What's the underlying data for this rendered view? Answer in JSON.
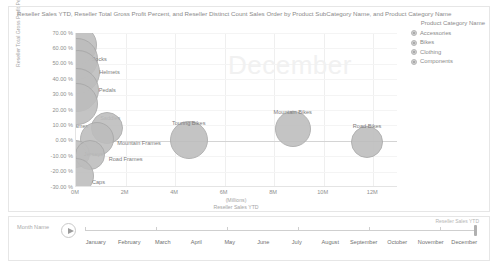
{
  "chart": {
    "title": "Reseller Sales YTD, Reseller Total Gross Profit Percent, and Reseller Distinct Count Sales Order by Product SubCategory Name, and Product Category Name",
    "watermark": "December"
  },
  "legend": {
    "title": "Product Category Name",
    "items": [
      {
        "label": "Accessories",
        "color": "#cfcfcf"
      },
      {
        "label": "Bikes",
        "color": "#cfcfcf"
      },
      {
        "label": "Clothing",
        "color": "#cfcfcf"
      },
      {
        "label": "Components",
        "color": "#cfcfcf"
      }
    ]
  },
  "slicer": {
    "field_label": "Month Name",
    "play_icon": "play-icon",
    "measure_label": "Reseller Sales YTD",
    "selected": "December",
    "months": [
      "January",
      "February",
      "March",
      "April",
      "May",
      "June",
      "July",
      "August",
      "September",
      "October",
      "November",
      "December"
    ]
  },
  "chart_data": {
    "type": "scatter",
    "title": "Reseller Sales YTD, Reseller Total Gross Profit Percent, and Reseller Distinct Count Sales Order by Product SubCategory Name, and Product Category Name",
    "xlabel": "Reseller Sales YTD",
    "xunit": "(Millions)",
    "ylabel": "Reseller Total Gross Profit Percent",
    "xlim": [
      0,
      13
    ],
    "ylim": [
      -30,
      70
    ],
    "xticks": [
      "0M",
      "2M",
      "4M",
      "6M",
      "8M",
      "10M",
      "12M"
    ],
    "xtickvals": [
      0,
      2,
      4,
      6,
      8,
      10,
      12
    ],
    "yticks": [
      "70.00 %",
      "60.00 %",
      "50.00 %",
      "40.00 %",
      "30.00 %",
      "20.00 %",
      "10.00 %",
      "0.00 %",
      "-10.00 %",
      "-20.00 %",
      "-30.00 %"
    ],
    "ytickvals": [
      70,
      60,
      50,
      40,
      30,
      20,
      10,
      0,
      -10,
      -20,
      -30
    ],
    "grid": true,
    "legend_position": "right",
    "size_label": "Reseller Distinct Count Sales Order",
    "points": [
      {
        "label": "Bike Racks",
        "category": "Accessories",
        "x": 0.05,
        "y": 62.5,
        "size": 20,
        "label_dx": 34,
        "label_dy": -16
      },
      {
        "label": "Socks",
        "category": "Clothing",
        "x": 0.05,
        "y": 53.0,
        "size": 21,
        "label_dx": 22,
        "label_dy": 0
      },
      {
        "label": "Helmets",
        "category": "Accessories",
        "x": 0.1,
        "y": 45.0,
        "size": 22,
        "label_dx": 31,
        "label_dy": 0
      },
      {
        "label": "Pedals",
        "category": "Components",
        "x": 0.05,
        "y": 33.0,
        "size": 22,
        "label_dx": 30,
        "label_dy": 0
      },
      {
        "label": "Saddles",
        "category": "Components",
        "x": 0.05,
        "y": 24.0,
        "size": 21,
        "label_dx": 33,
        "label_dy": 14
      },
      {
        "label": "Touring Frames",
        "category": "Components",
        "x": 1.25,
        "y": 8.5,
        "size": 16,
        "label_dx": -38,
        "label_dy": -2
      },
      {
        "label": "Mountain Frames",
        "category": "Components",
        "x": 0.85,
        "y": 1.0,
        "size": 17,
        "label_dx": 42,
        "label_dy": 4
      },
      {
        "label": "Jerseys",
        "category": "Clothing",
        "x": 0.02,
        "y": -8.5,
        "size": 14,
        "label_dx": 17,
        "label_dy": 0
      },
      {
        "label": "Road Frames",
        "category": "Components",
        "x": 0.55,
        "y": -9.0,
        "size": 15,
        "label_dx": 36,
        "label_dy": 4
      },
      {
        "label": "Caps",
        "category": "Clothing",
        "x": 0.02,
        "y": -23.0,
        "size": 18,
        "label_dx": 22,
        "label_dy": 6
      },
      {
        "label": "Touring Bikes",
        "category": "Bikes",
        "x": 4.55,
        "y": 0.5,
        "size": 19,
        "label_dx": 0,
        "label_dy": -17
      },
      {
        "label": "Mountain Bikes",
        "category": "Bikes",
        "x": 8.75,
        "y": 7.5,
        "size": 18,
        "label_dx": 0,
        "label_dy": -17
      },
      {
        "label": "Road Bikes",
        "category": "Bikes",
        "x": 11.75,
        "y": -1.0,
        "size": 16,
        "label_dx": 0,
        "label_dy": -16
      }
    ]
  }
}
